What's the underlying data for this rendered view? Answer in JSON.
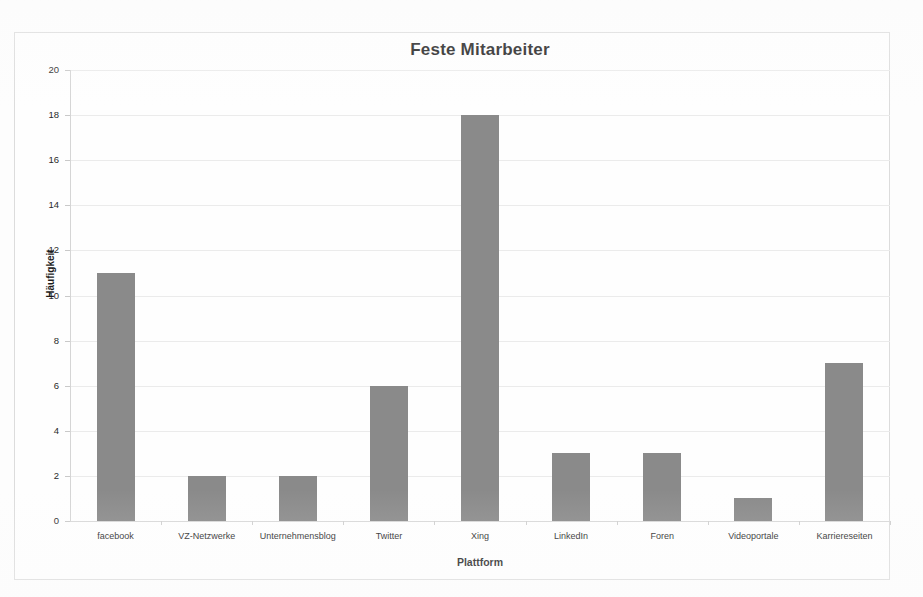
{
  "chart_data": {
    "type": "bar",
    "title": "Feste Mitarbeiter",
    "xlabel": "Plattform",
    "ylabel": "Häufigkeit",
    "categories": [
      "facebook",
      "VZ-Netzwerke",
      "Unternehmensblog",
      "Twitter",
      "Xing",
      "LinkedIn",
      "Foren",
      "Videoportale",
      "Karriereseiten"
    ],
    "values": [
      11,
      2,
      2,
      6,
      18,
      3,
      3,
      1,
      7
    ],
    "ylim": [
      0,
      20
    ],
    "ytick_step": 2,
    "ytick_labels": [
      "20",
      "18",
      "16",
      "14",
      "12",
      "10",
      "8",
      "6",
      "4",
      "2",
      "0"
    ],
    "grid": true,
    "grid_axis": "y",
    "legend": null,
    "legend_position": "none",
    "bar_color": "#8a8a8a",
    "grid_color": "#ebebeb",
    "frame_color": "#dcdcdc",
    "background_color": "#fefefe"
  }
}
